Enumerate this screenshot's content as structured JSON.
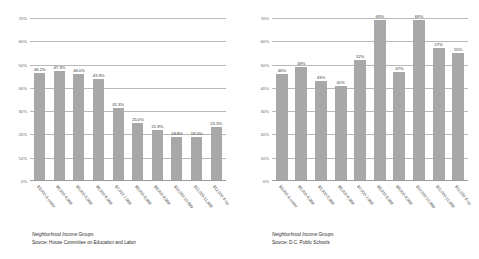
{
  "charts": [
    {
      "id": "left",
      "caption_title": "Neighborhood Income Groups",
      "caption_source": "Source: House Committee on Education and Labor",
      "chart_data": {
        "type": "bar",
        "title": "Neighborhood Income Groups",
        "xlabel": "Neighborhood Income Groups",
        "ylabel": "",
        "ylim": [
          0,
          70
        ],
        "grid": true,
        "legend": "none",
        "bar_color": "#a8a8a8",
        "yticks": [
          "0%",
          "10%",
          "20%",
          "30%",
          "40%",
          "50%",
          "60%",
          "70%"
        ],
        "ytick_values": [
          0,
          10,
          20,
          30,
          40,
          50,
          60,
          70
        ],
        "categories": [
          "$3,000 & under",
          "$4,000-4,999",
          "$5,000-5,999",
          "$6,000-6,999",
          "$7,000-7,999",
          "$8,000-8,999",
          "$9,000-9,999",
          "$10,000-10,999",
          "$11,000-11,999",
          "$12,000 & up"
        ],
        "values": [
          46.2,
          47.3,
          46.0,
          43.9,
          31.3,
          25.0,
          21.8,
          18.8,
          19.0,
          23.3
        ],
        "value_labels": [
          "46.2%",
          "47.3%",
          "46.0%",
          "43.9%",
          "31.3%",
          "25.0%",
          "21.8%",
          "18.8%",
          "19.0%",
          "23.3%"
        ]
      }
    },
    {
      "id": "right",
      "caption_title": "Neighborhood Income Groups",
      "caption_source": "Source: D.C. Public Schools",
      "chart_data": {
        "type": "bar",
        "title": "Neighborhood Income Groups",
        "xlabel": "Neighborhood Income Groups",
        "ylabel": "",
        "ylim": [
          0,
          70
        ],
        "grid": true,
        "legend": "none",
        "bar_color": "#a8a8a8",
        "yticks": [
          "0%",
          "10%",
          "20%",
          "30%",
          "40%",
          "50%",
          "60%",
          "70%"
        ],
        "ytick_values": [
          0,
          10,
          20,
          30,
          40,
          50,
          60,
          70
        ],
        "categories": [
          "$3,000 & under",
          "$4,000-4,999",
          "$5,000-5,999",
          "$6,000-6,999",
          "$7,000-7,999",
          "$8,000-8,999",
          "$9,000-9,999",
          "$10,000-10,999",
          "$11,000-11,999",
          "$12,000 & up"
        ],
        "values": [
          46,
          49,
          43,
          41,
          52,
          69,
          47,
          69,
          57,
          55
        ],
        "value_labels": [
          "46%",
          "49%",
          "43%",
          "41%",
          "52%",
          "69%",
          "47%",
          "69%",
          "57%",
          "55%"
        ]
      }
    }
  ]
}
